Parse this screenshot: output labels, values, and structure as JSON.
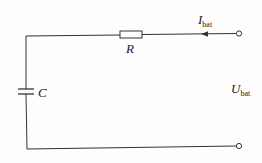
{
  "diagram": {
    "type": "circuit",
    "components": [
      {
        "id": "R",
        "kind": "resistor",
        "label": "R"
      },
      {
        "id": "C",
        "kind": "capacitor",
        "label": "C"
      }
    ],
    "labels": {
      "current": {
        "main": "I",
        "sub": "bat"
      },
      "voltage": {
        "main": "U",
        "sub": "bat"
      },
      "resistor": "R",
      "capacitor": "C"
    },
    "terminals": [
      "top-right",
      "bottom-right"
    ],
    "colors": {
      "line": "#333333",
      "background": "#fdfdfd"
    }
  }
}
